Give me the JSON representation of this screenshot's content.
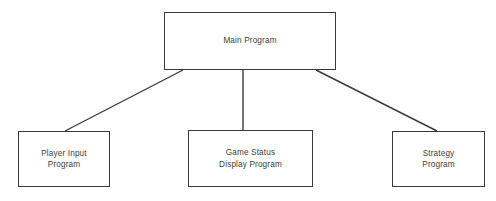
{
  "diagram": {
    "type": "hierarchy-tree",
    "background_color": "#ffffff",
    "line_color": "#3a3a3a",
    "text_color": "#404040",
    "nodes": [
      {
        "id": "main",
        "name": "main-program",
        "label": "Main Program",
        "level": "root"
      },
      {
        "id": "player_input",
        "name": "player-input-program",
        "label": "Player Input\nProgram",
        "level": "child"
      },
      {
        "id": "game_status",
        "name": "game-status-display-program",
        "label": "Game Status\nDisplay Program",
        "level": "child"
      },
      {
        "id": "strategy",
        "name": "strategy-program",
        "label": "Strategy\nProgram",
        "level": "child"
      }
    ],
    "connectors": [
      {
        "from": "main",
        "to": "player_input",
        "style": "diagonal"
      },
      {
        "from": "main",
        "to": "game_status",
        "style": "vertical"
      },
      {
        "from": "main",
        "to": "strategy",
        "style": "diagonal"
      }
    ]
  }
}
